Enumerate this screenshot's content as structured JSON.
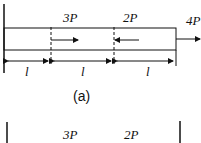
{
  "figure_a": {
    "loads": {
      "load1": "3P",
      "load2": "2P",
      "load3": "4P"
    },
    "segments": [
      "l",
      "l",
      "l"
    ],
    "caption": "(a)"
  },
  "figure_b": {
    "loads": {
      "load1": "3P",
      "load2": "2P"
    }
  }
}
